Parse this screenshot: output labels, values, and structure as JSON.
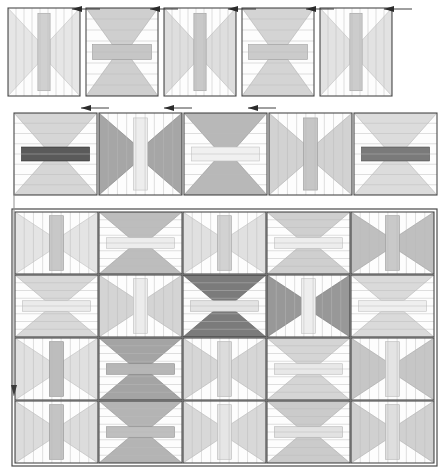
{
  "document": {
    "title": "Quilt block layout diagram",
    "background": "#ffffff",
    "width": 444,
    "height": 475
  },
  "palette": {
    "outline": "#4a4a4a",
    "grid_line": "#9b9b9b",
    "strip_line": "#b9b9b9",
    "arrow": "#2b2b2b",
    "guide_line": "#8f8f8f",
    "shade_0": "#ffffff",
    "shade_1": "#f2f2f2",
    "shade_2": "#e6e6e6",
    "shade_3": "#d9d9d9",
    "shade_4": "#cccccc",
    "shade_5": "#bdbdbd",
    "shade_6": "#a8a8a8",
    "shade_7": "#8c8c8c",
    "shade_8": "#6e6e6e",
    "shade_9": "#555555"
  },
  "sections": [
    {
      "name": "top-row",
      "label": "Row 1",
      "x": 8,
      "y": 8,
      "tile_w": 72,
      "tile_h": 88,
      "gap": 6,
      "columns": 5,
      "tiles": [
        {
          "id": "r1c1",
          "orient": "V",
          "fill": "#e6e6e6",
          "center": "#d0d0d0",
          "strips": 9
        },
        {
          "id": "r1c2",
          "orient": "H",
          "fill": "#cfcfcf",
          "center": "#c6c6c6",
          "strips": 8
        },
        {
          "id": "r1c3",
          "orient": "V",
          "fill": "#dedede",
          "center": "#c9c9c9",
          "strips": 9
        },
        {
          "id": "r1c4",
          "orient": "H",
          "fill": "#d4d4d4",
          "center": "#cbcbcb",
          "strips": 8
        },
        {
          "id": "r1c5",
          "orient": "V",
          "fill": "#e2e2e2",
          "center": "#cccccc",
          "strips": 9
        }
      ],
      "arrows": [
        {
          "id": "a1",
          "x": 86,
          "y": 5,
          "dir": "left"
        },
        {
          "id": "a2",
          "x": 164,
          "y": 5,
          "dir": "left"
        },
        {
          "id": "a3",
          "x": 242,
          "y": 5,
          "dir": "left"
        },
        {
          "id": "a4",
          "x": 320,
          "y": 5,
          "dir": "left"
        },
        {
          "id": "a5",
          "x": 398,
          "y": 5,
          "dir": "left"
        }
      ]
    },
    {
      "name": "middle-row",
      "label": "Row 2",
      "x": 14,
      "y": 113,
      "tile_w": 83,
      "tile_h": 82,
      "gap": 2,
      "columns": 5,
      "tiles": [
        {
          "id": "r2c1",
          "orient": "H",
          "fill": "#d6d6d6",
          "center": "#5a5a5a",
          "strips": 8
        },
        {
          "id": "r2c2",
          "orient": "V",
          "fill": "#a6a6a6",
          "center": "#ededed",
          "strips": 9
        },
        {
          "id": "r2c3",
          "orient": "H",
          "fill": "#b8b8b8",
          "center": "#f0f0f0",
          "strips": 8
        },
        {
          "id": "r2c4",
          "orient": "V",
          "fill": "#d2d2d2",
          "center": "#c6c6c6",
          "strips": 9
        },
        {
          "id": "r2c5",
          "orient": "H",
          "fill": "#dcdcdc",
          "center": "#7a7a7a",
          "strips": 8
        }
      ],
      "arrows": [
        {
          "id": "a6",
          "x": 95,
          "y": 104,
          "dir": "left"
        },
        {
          "id": "a7",
          "x": 178,
          "y": 104,
          "dir": "left"
        },
        {
          "id": "a8",
          "x": 262,
          "y": 104,
          "dir": "left"
        }
      ]
    },
    {
      "name": "main-grid",
      "label": "Main layout grid",
      "x": 15,
      "y": 212,
      "tile_w": 83,
      "tile_h": 62,
      "gap": 1,
      "columns": 5,
      "rows": 4,
      "tiles": [
        {
          "id": "g1c1",
          "orient": "V",
          "fill": "#e4e4e4",
          "center": "#c8c8c8",
          "strips": 9
        },
        {
          "id": "g1c2",
          "orient": "H",
          "fill": "#bdbdbd",
          "center": "#ededed",
          "strips": 8
        },
        {
          "id": "g1c3",
          "orient": "V",
          "fill": "#e0e0e0",
          "center": "#d2d2d2",
          "strips": 9
        },
        {
          "id": "g1c4",
          "orient": "H",
          "fill": "#cfcfcf",
          "center": "#ededed",
          "strips": 8
        },
        {
          "id": "g1c5",
          "orient": "V",
          "fill": "#bfbfbf",
          "center": "#c9c9c9",
          "strips": 9
        },
        {
          "id": "g2c1",
          "orient": "H",
          "fill": "#d8d8d8",
          "center": "#ebebeb",
          "strips": 8
        },
        {
          "id": "g2c2",
          "orient": "V",
          "fill": "#d4d4d4",
          "center": "#ececec",
          "strips": 9
        },
        {
          "id": "g2c3",
          "orient": "H",
          "fill": "#7b7b7b",
          "center": "#e3e3e3",
          "strips": 8
        },
        {
          "id": "g2c4",
          "orient": "V",
          "fill": "#989898",
          "center": "#eeeeee",
          "strips": 9
        },
        {
          "id": "g2c5",
          "orient": "H",
          "fill": "#dadada",
          "center": "#efefef",
          "strips": 8
        },
        {
          "id": "g3c1",
          "orient": "V",
          "fill": "#e0e0e0",
          "center": "#bdbdbd",
          "strips": 9
        },
        {
          "id": "g3c2",
          "orient": "H",
          "fill": "#a4a4a4",
          "center": "#b6b6b6",
          "strips": 8
        },
        {
          "id": "g3c3",
          "orient": "V",
          "fill": "#d6d6d6",
          "center": "#dcdcdc",
          "strips": 9
        },
        {
          "id": "g3c4",
          "orient": "H",
          "fill": "#d5d5d5",
          "center": "#e8e8e8",
          "strips": 8
        },
        {
          "id": "g3c5",
          "orient": "V",
          "fill": "#c6c6c6",
          "center": "#e4e4e4",
          "strips": 9
        },
        {
          "id": "g4c1",
          "orient": "V",
          "fill": "#dcdcdc",
          "center": "#c4c4c4",
          "strips": 9
        },
        {
          "id": "g4c2",
          "orient": "H",
          "fill": "#b4b4b4",
          "center": "#bfbfbf",
          "strips": 8
        },
        {
          "id": "g4c3",
          "orient": "V",
          "fill": "#d8d8d8",
          "center": "#e6e6e6",
          "strips": 9
        },
        {
          "id": "g4c4",
          "orient": "H",
          "fill": "#cbcbcb",
          "center": "#e2e2e2",
          "strips": 8
        },
        {
          "id": "g4c5",
          "orient": "V",
          "fill": "#d0d0d0",
          "center": "#dedede",
          "strips": 9
        }
      ]
    }
  ],
  "guides": [
    {
      "id": "left-guide",
      "x": 14,
      "y1": 170,
      "y2": 396,
      "dir": "down"
    }
  ]
}
